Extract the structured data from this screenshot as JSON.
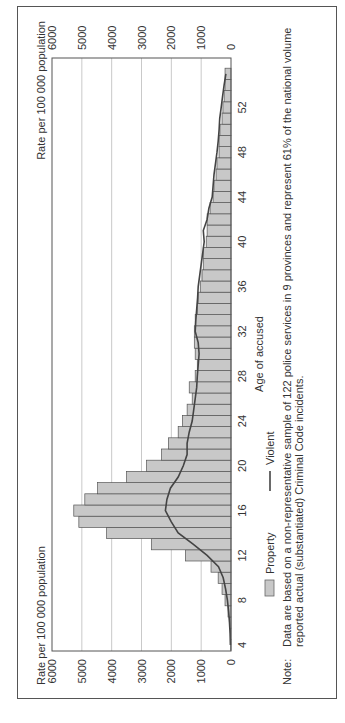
{
  "orientation": "rotated-90-ccw",
  "chart_data": {
    "type": "bar",
    "title": "",
    "xlabel": "Age of accused",
    "ylabel": "Rate per 100 000 population",
    "ylabel_right": "Rate per 100 000 population",
    "ylim": [
      0,
      6000
    ],
    "yticks": [
      0,
      1000,
      2000,
      3000,
      4000,
      5000,
      6000
    ],
    "xticks": [
      4,
      8,
      12,
      16,
      20,
      24,
      28,
      32,
      36,
      40,
      44,
      48,
      52
    ],
    "grid": true,
    "legend_position": "bottom",
    "x": [
      4,
      5,
      6,
      7,
      8,
      9,
      10,
      11,
      12,
      13,
      14,
      15,
      16,
      17,
      18,
      19,
      20,
      21,
      22,
      23,
      24,
      25,
      26,
      27,
      28,
      29,
      30,
      31,
      32,
      33,
      34,
      35,
      36,
      37,
      38,
      39,
      40,
      41,
      42,
      43,
      44,
      45,
      46,
      47,
      48,
      49,
      50,
      51,
      52,
      53,
      54,
      55
    ],
    "series": [
      {
        "name": "Property",
        "type": "bar",
        "color": "#c8c8c8",
        "values": [
          10,
          20,
          50,
          100,
          200,
          300,
          430,
          670,
          1530,
          2670,
          4170,
          5100,
          5270,
          4900,
          4470,
          3500,
          2830,
          2330,
          2100,
          1770,
          1630,
          1470,
          1300,
          1400,
          1200,
          1130,
          1200,
          1230,
          1230,
          1200,
          1130,
          1100,
          1030,
          970,
          930,
          930,
          830,
          800,
          800,
          700,
          600,
          570,
          500,
          470,
          400,
          400,
          370,
          300,
          270,
          230,
          200,
          200
        ]
      },
      {
        "name": "Violent",
        "type": "line",
        "color": "#444444",
        "values": [
          20,
          30,
          50,
          80,
          120,
          180,
          260,
          420,
          800,
          1270,
          1770,
          2000,
          2200,
          2150,
          2030,
          1770,
          1600,
          1470,
          1470,
          1400,
          1300,
          1250,
          1200,
          1150,
          1130,
          1100,
          1070,
          1100,
          1200,
          1180,
          1150,
          1120,
          1100,
          1050,
          1000,
          950,
          900,
          930,
          800,
          740,
          630,
          600,
          570,
          520,
          470,
          430,
          400,
          380,
          330,
          280,
          230,
          170
        ]
      }
    ]
  },
  "axis": {
    "left_title": "Rate per 100 000 population",
    "right_title": "Rate per 100 000 population",
    "x_title": "Age of accused"
  },
  "legend": {
    "property": "Property",
    "violent": "Violent"
  },
  "note": {
    "label": "Note:",
    "line1": "Data are based on a non-representative sample of 122 police services in 9 provinces and represent 61% of the national volume",
    "line2": "reported actual (substantiated) Criminal Code incidents."
  }
}
